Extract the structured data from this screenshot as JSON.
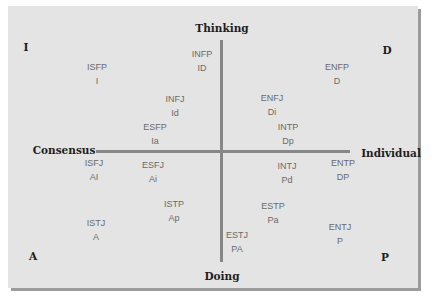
{
  "diagram": {
    "axes": {
      "top": "Thinking",
      "bottom": "Doing",
      "left": "Consensus",
      "right": "Individual"
    },
    "corners": {
      "top_left": "I",
      "top_right": "D",
      "bottom_left": "A",
      "bottom_right": "P"
    },
    "colors": {
      "panel_fill": "#e4e4e4",
      "panel_shadow": "#9c9c9c",
      "axis_line": "#878787",
      "type_text": "#6a6a6a",
      "label_text": "#1e1e1e"
    },
    "types": [
      {
        "code": "ISFP",
        "abbr": "I",
        "x": 97,
        "y": 60
      },
      {
        "code": "INFP",
        "abbr": "ID",
        "x": 202,
        "y": 47
      },
      {
        "code": "INFJ",
        "abbr": "Id",
        "x": 175,
        "y": 92
      },
      {
        "code": "ESFP",
        "abbr": "Ia",
        "x": 155,
        "y": 120
      },
      {
        "code": "ENFP",
        "abbr": "D",
        "x": 337,
        "y": 60
      },
      {
        "code": "ENFJ",
        "abbr": "Di",
        "x": 272,
        "y": 91
      },
      {
        "code": "INTP",
        "abbr": "Dp",
        "x": 288,
        "y": 120
      },
      {
        "code": "ISFJ",
        "abbr": "AI",
        "x": 94,
        "y": 156
      },
      {
        "code": "ESFJ",
        "abbr": "Ai",
        "x": 153,
        "y": 158
      },
      {
        "code": "ISTP",
        "abbr": "Ap",
        "x": 174,
        "y": 197
      },
      {
        "code": "ISTJ",
        "abbr": "A",
        "x": 96,
        "y": 216
      },
      {
        "code": "INTJ",
        "abbr": "Pd",
        "x": 287,
        "y": 159
      },
      {
        "code": "ENTP",
        "abbr": "DP",
        "x": 343,
        "y": 156
      },
      {
        "code": "ESTP",
        "abbr": "Pa",
        "x": 273,
        "y": 199
      },
      {
        "code": "ENTJ",
        "abbr": "P",
        "x": 340,
        "y": 220
      },
      {
        "code": "ESTJ",
        "abbr": "PA",
        "x": 237,
        "y": 228
      }
    ]
  }
}
